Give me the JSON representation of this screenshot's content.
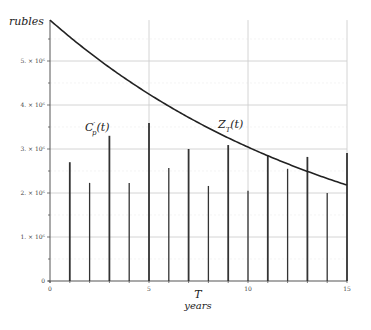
{
  "chart_data": {
    "type": "bar+line",
    "title": "",
    "xlabel": "T",
    "xlabel_sub": "years",
    "ylabel": "rubles",
    "xlim": [
      0,
      15
    ],
    "ylim": [
      0,
      6000000
    ],
    "x_ticks": [
      0,
      5,
      10,
      15
    ],
    "x_tick_labels": [
      "0",
      "5",
      "10",
      "15"
    ],
    "y_ticks": [
      0,
      1000000,
      2000000,
      3000000,
      4000000,
      5000000
    ],
    "y_tick_labels": [
      "0",
      "1. × 10⁶",
      "2. × 10⁶",
      "3. × 10⁶",
      "4. × 10⁶",
      "5. × 10⁶"
    ],
    "grid": true,
    "legend": "none (inline labels)",
    "series": [
      {
        "name": "C'p(t)",
        "label_main": "C",
        "label_sup": "′",
        "label_sub": "p",
        "label_tail": "(t)",
        "type": "bar",
        "x": [
          1,
          2,
          3,
          4,
          5,
          6,
          7,
          8,
          9,
          10,
          11,
          12,
          13,
          14,
          15
        ],
        "values": [
          2700000,
          2230000,
          3300000,
          2230000,
          3590000,
          2570000,
          3000000,
          2160000,
          3090000,
          2050000,
          2860000,
          2550000,
          2820000,
          2000000,
          2910000
        ]
      },
      {
        "name": "Z_T(t)",
        "label_main": "Z",
        "label_sub": "T",
        "label_tail": "(t)",
        "type": "line",
        "x": [
          0,
          1,
          2,
          3,
          4,
          5,
          6,
          7,
          8,
          9,
          10,
          11,
          12,
          13,
          14,
          15
        ],
        "values": [
          5930000,
          5550000,
          5200000,
          4870000,
          4560000,
          4270000,
          4000000,
          3740000,
          3500000,
          3280000,
          3070000,
          2880000,
          2690000,
          2520000,
          2360000,
          2180000
        ]
      }
    ],
    "annotations": [
      {
        "text": "C'p(t)",
        "near": "bar at t=3"
      },
      {
        "text": "Z_T(t)",
        "near": "curve at t≈9"
      }
    ]
  },
  "colors": {
    "bars": "#333333",
    "curve": "#222222",
    "grid": "#cfcfcf",
    "axis": "#555555"
  }
}
